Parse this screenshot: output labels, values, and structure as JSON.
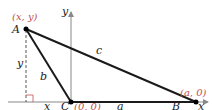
{
  "diagram": {
    "colors": {
      "line": "#1a1a1a",
      "axis": "#888888",
      "coord_label": "#c0504d"
    },
    "points": {
      "A": {
        "name": "A",
        "coord_label": "(x, y)"
      },
      "B": {
        "name": "B",
        "coord_label": "(a, 0)"
      },
      "C": {
        "name": "C",
        "coord_label": "(0, 0)"
      }
    },
    "sides": {
      "a": "a",
      "b": "b",
      "c": "c"
    },
    "axes": {
      "x_label": "x",
      "y_label": "y"
    },
    "dimensions": {
      "horizontal": "x",
      "vertical": "y"
    }
  }
}
